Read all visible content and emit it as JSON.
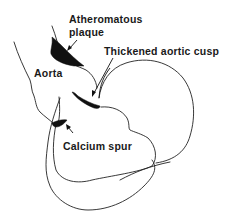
{
  "diagram": {
    "labels": {
      "atheromatous_line1": "Atheromatous",
      "atheromatous_line2": "plaque",
      "thickened_cusp": "Thickened aortic cusp",
      "aorta": "Aorta",
      "calcium_spur": "Calcium spur"
    },
    "colors": {
      "background": "#ffffff",
      "ink": "#111111"
    }
  }
}
